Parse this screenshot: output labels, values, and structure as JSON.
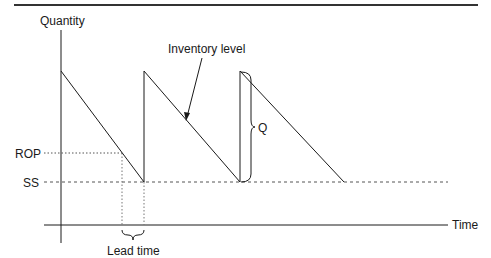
{
  "diagram": {
    "type": "inventory-sawtooth",
    "labels": {
      "y_axis": "Quantity",
      "x_axis": "Time",
      "rop": "ROP",
      "ss": "SS",
      "inventory_level": "Inventory level",
      "order_quantity": "Q",
      "lead_time": "Lead time"
    },
    "colors": {
      "line": "#1a1a1a",
      "dotted": "#555555"
    }
  }
}
